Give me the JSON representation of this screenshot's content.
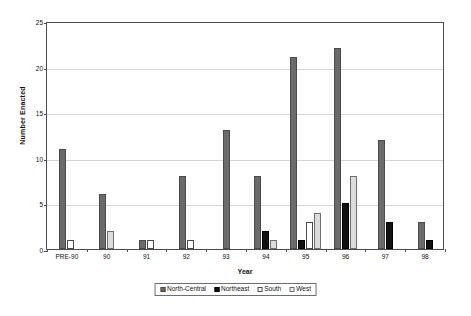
{
  "chart_data": {
    "type": "bar",
    "title": "",
    "xlabel": "Year",
    "ylabel": "Number Enacted",
    "ylim": [
      0,
      25
    ],
    "yticks": [
      0,
      5,
      10,
      15,
      20,
      25
    ],
    "grid": true,
    "legend_position": "bottom",
    "categories": [
      "PRE-90",
      "90",
      "91",
      "92",
      "93",
      "94",
      "95",
      "96",
      "97",
      "98"
    ],
    "series": [
      {
        "name": "North-Central",
        "color": "#6b6b6b",
        "values": [
          11,
          6,
          1,
          8,
          13,
          8,
          21,
          22,
          12,
          3
        ]
      },
      {
        "name": "Northeast",
        "color": "#111111",
        "values": [
          0,
          0,
          0,
          0,
          0,
          2,
          1,
          5,
          3,
          1
        ]
      },
      {
        "name": "South",
        "color": "#ffffff",
        "values": [
          1,
          0,
          1,
          1,
          0,
          0,
          3,
          0,
          0,
          0
        ]
      },
      {
        "name": "West",
        "color": "#dcdcdc",
        "values": [
          0,
          2,
          0,
          0,
          0,
          1,
          4,
          8,
          0,
          0
        ]
      }
    ]
  }
}
